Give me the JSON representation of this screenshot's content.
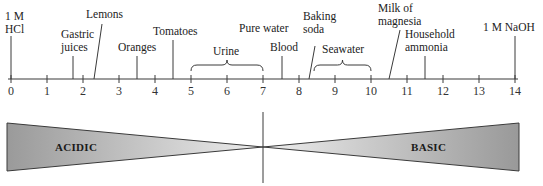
{
  "diagram": {
    "axis": {
      "min": 0,
      "max": 14,
      "ticks": [
        "0",
        "1",
        "2",
        "3",
        "4",
        "5",
        "6",
        "7",
        "8",
        "9",
        "10",
        "11",
        "12",
        "13",
        "14"
      ],
      "x0_px": 11,
      "x14_px": 515,
      "y_px": 79
    },
    "substances": [
      {
        "lines": [
          "1 M",
          "HCl"
        ],
        "ph": 0,
        "type": "point"
      },
      {
        "lines": [
          "Gastric",
          "juices"
        ],
        "ph": 1.7,
        "type": "point"
      },
      {
        "lines": [
          "Lemons"
        ],
        "ph": 2.3,
        "type": "slanted"
      },
      {
        "lines": [
          "Oranges"
        ],
        "ph": 3.5,
        "type": "point"
      },
      {
        "lines": [
          "Tomatoes"
        ],
        "ph": 4.5,
        "type": "point"
      },
      {
        "lines": [
          "Urine"
        ],
        "ph_range": [
          5,
          7
        ],
        "type": "range"
      },
      {
        "lines": [
          "Pure water"
        ],
        "ph": 7,
        "type": "label-only"
      },
      {
        "lines": [
          "Blood"
        ],
        "ph": 7.4,
        "type": "point"
      },
      {
        "lines": [
          "Baking",
          "soda"
        ],
        "ph": 8.3,
        "type": "slanted"
      },
      {
        "lines": [
          "Seawater"
        ],
        "ph_range": [
          8.5,
          10
        ],
        "type": "range"
      },
      {
        "lines": [
          "Milk of",
          "magnesia"
        ],
        "ph": 10.5,
        "type": "slanted"
      },
      {
        "lines": [
          "Household",
          "ammonia"
        ],
        "ph": 11.5,
        "type": "point"
      },
      {
        "lines": [
          "1 M NaOH"
        ],
        "ph": 14,
        "type": "point"
      }
    ],
    "zones": {
      "acidic_label": "ACIDIC",
      "basic_label": "BASIC",
      "neutral_ph": 7
    },
    "colors": {
      "line": "#3a3a3a",
      "wedge_dark": "#9a9a9a",
      "wedge_light": "#ececec"
    }
  }
}
